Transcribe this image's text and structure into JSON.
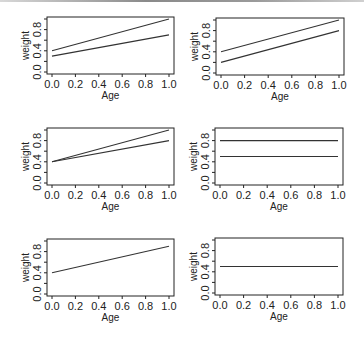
{
  "figure": {
    "rows": 3,
    "cols": 2,
    "line_color": "#333333",
    "axis_color": "#222222",
    "background": "#ffffff"
  },
  "chart_data": [
    {
      "type": "line",
      "panel": "row1-col1",
      "xlabel": "Age",
      "ylabel": "weight",
      "xlim": [
        0.0,
        1.0
      ],
      "ylim": [
        0.0,
        1.0
      ],
      "xticks": [
        "0.0",
        "0.2",
        "0.4",
        "0.6",
        "0.8",
        "1.0"
      ],
      "yticks": [
        "0.0",
        "0.4",
        "0.8"
      ],
      "grid": false,
      "series": [
        {
          "name": "line-1",
          "x": [
            0.0,
            1.0
          ],
          "y": [
            0.4,
            1.0
          ]
        },
        {
          "name": "line-2",
          "x": [
            0.0,
            1.0
          ],
          "y": [
            0.3,
            0.7
          ]
        }
      ]
    },
    {
      "type": "line",
      "panel": "row1-col2",
      "xlabel": "Age",
      "ylabel": "weight",
      "xlim": [
        0.0,
        1.0
      ],
      "ylim": [
        0.0,
        1.0
      ],
      "xticks": [
        "0.0",
        "0.2",
        "0.4",
        "0.6",
        "0.8",
        "1.0"
      ],
      "yticks": [
        "0.0",
        "0.4",
        "0.8"
      ],
      "grid": false,
      "series": [
        {
          "name": "line-1",
          "x": [
            0.0,
            1.0
          ],
          "y": [
            0.4,
            1.0
          ]
        },
        {
          "name": "line-2",
          "x": [
            0.0,
            1.0
          ],
          "y": [
            0.2,
            0.8
          ]
        }
      ]
    },
    {
      "type": "line",
      "panel": "row2-col1",
      "xlabel": "Age",
      "ylabel": "weight",
      "xlim": [
        0.0,
        1.0
      ],
      "ylim": [
        0.0,
        1.0
      ],
      "xticks": [
        "0.0",
        "0.2",
        "0.4",
        "0.6",
        "0.8",
        "1.0"
      ],
      "yticks": [
        "0.0",
        "0.4",
        "0.8"
      ],
      "grid": false,
      "series": [
        {
          "name": "line-1",
          "x": [
            0.0,
            1.0
          ],
          "y": [
            0.4,
            1.0
          ]
        },
        {
          "name": "line-2",
          "x": [
            0.0,
            1.0
          ],
          "y": [
            0.4,
            0.8
          ]
        }
      ]
    },
    {
      "type": "line",
      "panel": "row2-col2",
      "xlabel": "Age",
      "ylabel": "weight",
      "xlim": [
        0.0,
        1.0
      ],
      "ylim": [
        0.0,
        1.0
      ],
      "xticks": [
        "0.0",
        "0.2",
        "0.4",
        "0.6",
        "0.8",
        "1.0"
      ],
      "yticks": [
        "0.0",
        "0.4",
        "0.8"
      ],
      "grid": false,
      "series": [
        {
          "name": "line-1",
          "x": [
            0.0,
            1.0
          ],
          "y": [
            0.8,
            0.8
          ]
        },
        {
          "name": "line-2",
          "x": [
            0.0,
            1.0
          ],
          "y": [
            0.5,
            0.5
          ]
        }
      ]
    },
    {
      "type": "line",
      "panel": "row3-col1",
      "xlabel": "Age",
      "ylabel": "weight",
      "xlim": [
        0.0,
        1.0
      ],
      "ylim": [
        0.0,
        1.0
      ],
      "xticks": [
        "0.0",
        "0.2",
        "0.4",
        "0.6",
        "0.8",
        "1.0"
      ],
      "yticks": [
        "0.0",
        "0.4",
        "0.8"
      ],
      "grid": false,
      "series": [
        {
          "name": "line-1",
          "x": [
            0.0,
            1.0
          ],
          "y": [
            0.4,
            0.9
          ]
        }
      ]
    },
    {
      "type": "line",
      "panel": "row3-col2",
      "xlabel": "Age",
      "ylabel": "weight",
      "xlim": [
        0.0,
        1.0
      ],
      "ylim": [
        0.0,
        1.0
      ],
      "xticks": [
        "0.0",
        "0.2",
        "0.4",
        "0.6",
        "0.8",
        "1.0"
      ],
      "yticks": [
        "0.0",
        "0.4",
        "0.8"
      ],
      "grid": false,
      "series": [
        {
          "name": "line-1",
          "x": [
            0.0,
            1.0
          ],
          "y": [
            0.5,
            0.5
          ]
        }
      ]
    }
  ]
}
